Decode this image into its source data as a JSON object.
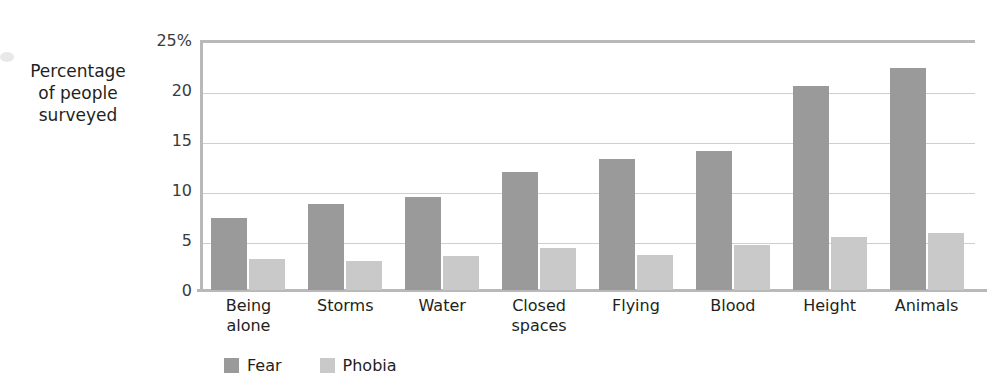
{
  "chart_data": {
    "type": "bar",
    "title": "",
    "xlabel": "",
    "ylabel": "Percentage\nof people\nsurveyed",
    "ylim": [
      0,
      25
    ],
    "grid": true,
    "legend_position": "bottom-left",
    "categories": [
      "Being\nalone",
      "Storms",
      "Water",
      "Closed\nspaces",
      "Flying",
      "Blood",
      "Height",
      "Animals"
    ],
    "y_ticks": [
      "25%",
      "20",
      "15",
      "10",
      "5",
      "0"
    ],
    "y_tick_values": [
      25,
      20,
      15,
      10,
      5,
      0
    ],
    "series": [
      {
        "name": "Fear",
        "color": "#9a9a9a",
        "values": [
          7.2,
          8.6,
          9.3,
          11.8,
          13.1,
          13.9,
          20.4,
          22.2
        ]
      },
      {
        "name": "Phobia",
        "color": "#c9c9c9",
        "values": [
          3.1,
          2.9,
          3.4,
          4.2,
          3.5,
          4.5,
          5.3,
          5.7
        ]
      }
    ]
  },
  "legend": {
    "items": [
      {
        "label": "Fear",
        "color": "#9a9a9a"
      },
      {
        "label": "Phobia",
        "color": "#c9c9c9"
      }
    ]
  },
  "axis": {
    "y_title": "Percentage\nof people\nsurveyed"
  },
  "colors": {
    "fear": "#9a9a9a",
    "phobia": "#c9c9c9",
    "gridline": "#cfcfcf",
    "frame": "#b9b9b9",
    "text": "#231f20"
  }
}
